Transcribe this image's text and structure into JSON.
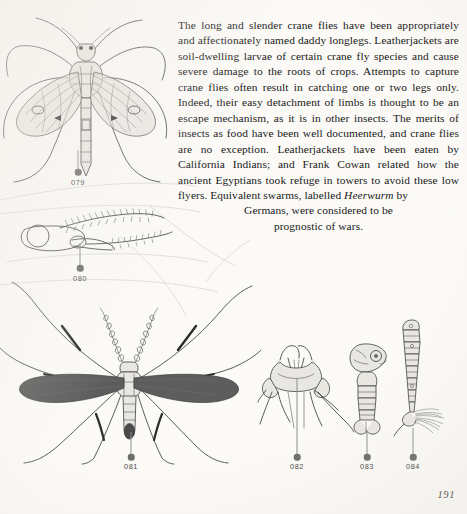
{
  "page": {
    "number": "191",
    "paper_color": "#fbfaf7",
    "ink_color": "#181818"
  },
  "article": {
    "paragraph": "The long and slender crane flies have been appropriately and affectionately named daddy longlegs. Leatherjackets are soil-dwelling larvae of certain crane fly species and cause severe damage to the roots of crops. Attempts to capture crane flies often result in catching one or two legs only. Indeed, their easy detachment of limbs is thought to be an escape mechanism, as it is in other insects. The merits of insects as food have been well documented, and crane flies are no exception. Leatherjackets have been eaten by California Indians; and Frank Cowan related how the ancient Egyptians took refuge in towers to avoid these low flyers. Equivalent swarms, labelled ",
    "italic_term": "Heerwurm",
    "paragraph_after_italic": " by",
    "tail_line_1": "Germans, were considered to be",
    "tail_line_2": "prognostic of wars."
  },
  "figures": [
    {
      "id": "079",
      "label": "079",
      "caption_x": 78,
      "caption_y": 180,
      "subject": "crane-fly-adult-dorsal"
    },
    {
      "id": "080",
      "label": "080",
      "caption_x": 80,
      "caption_y": 277,
      "subject": "crane-fly-head-antenna-detail"
    },
    {
      "id": "081",
      "label": "081",
      "caption_x": 131,
      "caption_y": 466,
      "subject": "crane-fly-adult-dark-winged"
    },
    {
      "id": "082",
      "label": "082",
      "caption_x": 297,
      "caption_y": 466,
      "subject": "crane-fly-thorax-legs-detail"
    },
    {
      "id": "083",
      "label": "083",
      "caption_x": 367,
      "caption_y": 466,
      "subject": "crane-fly-pupa"
    },
    {
      "id": "084",
      "label": "084",
      "caption_x": 413,
      "caption_y": 466,
      "subject": "crane-fly-larva-leatherjacket"
    }
  ]
}
